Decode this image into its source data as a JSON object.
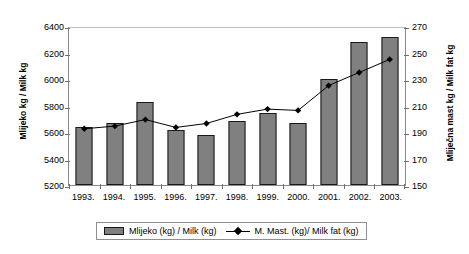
{
  "chart_data": {
    "type": "bar",
    "title": "",
    "xlabel": "",
    "ylabel": "Mlijeko kg / Milk kg",
    "y2label": "Mliječna mast kg / Milk fat kg",
    "categories": [
      "1993.",
      "1994.",
      "1995.",
      "1996.",
      "1997.",
      "1998.",
      "1999.",
      "2000.",
      "2001.",
      "2002.",
      "2003."
    ],
    "ylim": [
      5200,
      6400
    ],
    "yticks": [
      5200,
      5400,
      5600,
      5800,
      6000,
      6200,
      6400
    ],
    "y2lim": [
      150,
      270
    ],
    "y2ticks": [
      150,
      170,
      190,
      210,
      230,
      250,
      270
    ],
    "grid": false,
    "legend_position": "bottom",
    "series": [
      {
        "name": "Mlijeko (kg) / Milk (kg)",
        "type": "bar",
        "axis": "left",
        "color": "#808080",
        "values": [
          5640,
          5670,
          5825,
          5615,
          5580,
          5680,
          5745,
          5665,
          6000,
          6280,
          6320
        ]
      },
      {
        "name": "M. Mast. (kg)/ Milk fat (kg)",
        "type": "line",
        "axis": "right",
        "color": "#000000",
        "values": [
          193,
          195,
          200,
          194,
          197,
          204,
          208,
          207,
          226,
          236,
          246
        ]
      }
    ]
  },
  "legend": {
    "bar_label": "Mlijeko (kg) / Milk (kg)",
    "line_label": "M. Mast. (kg)/ Milk fat (kg)"
  }
}
